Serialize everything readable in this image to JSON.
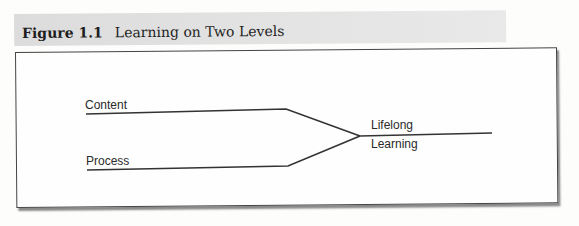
{
  "figure": {
    "number": "Figure 1.1",
    "title": "Learning on Two Levels"
  },
  "diagram": {
    "inputs": [
      {
        "label": "Content"
      },
      {
        "label": "Process"
      }
    ],
    "output": {
      "line1": "Lifelong",
      "line2": "Learning"
    }
  }
}
